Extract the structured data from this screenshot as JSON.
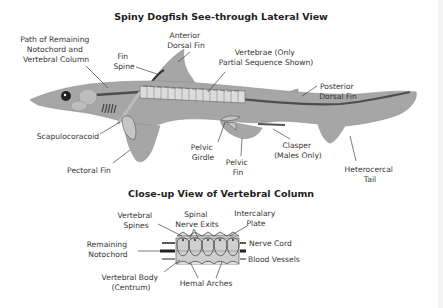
{
  "main_title": "Spiny Dogfish See-through Lateral View",
  "sub_title": "Close-up View of Vertebral Column",
  "colors": {
    "body": "#a6a6a6",
    "body_outline": "#8f8f8f",
    "notochord": "#4d4d4d",
    "vertebra": "#d9d9d9",
    "text": "#333333",
    "background": "#ffffff"
  },
  "lateral_labels": {
    "notochord_path": [
      "Path of Remaining",
      "Notochord and",
      "Vertebral Column"
    ],
    "fin_spine": [
      "Fin",
      "Spine"
    ],
    "anterior_dorsal_fin": [
      "Anterior",
      "Dorsal Fin"
    ],
    "vertebrae": [
      "Vertebrae (Only",
      "Partial Sequence Shown)"
    ],
    "posterior_dorsal_fin": [
      "Posterior",
      "Dorsal Fin"
    ],
    "scapulocoracoid": [
      "Scapulocoracoid"
    ],
    "pectoral_fin": [
      "Pectoral Fin"
    ],
    "pelvic_girdle": [
      "Pelvic",
      "Girdle"
    ],
    "pelvic_fin": [
      "Pelvic",
      "Fin"
    ],
    "clasper": [
      "Clasper",
      "(Males Only)"
    ],
    "heterocercal_tail": [
      "Heterocercal",
      "Tail"
    ]
  },
  "closeup_labels": {
    "vertebral_spines": [
      "Vertebral",
      "Spines"
    ],
    "spinal_nerve_exits": [
      "Spinal",
      "Nerve Exits"
    ],
    "intercalary_plate": [
      "Intercalary",
      "Plate"
    ],
    "remaining_notochord": [
      "Remaining",
      "Notochord"
    ],
    "nerve_cord": [
      "Nerve Cord"
    ],
    "blood_vessels": [
      "Blood Vessels"
    ],
    "vertebral_body": [
      "Vertebral Body",
      "(Centrum)"
    ],
    "hemal_arches": [
      "Hemal Arches"
    ]
  }
}
